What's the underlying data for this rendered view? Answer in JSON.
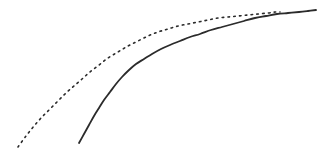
{
  "figure": {
    "title": "",
    "background_color": "#ffffff",
    "width": 331,
    "height": 153
  },
  "chart_data": {
    "type": "line",
    "title": "",
    "subtitle": "",
    "xlabel": "",
    "ylabel": "",
    "xlim": [
      0,
      331
    ],
    "ylim": [
      0,
      153
    ],
    "grid": false,
    "axes_visible": false,
    "tick_labels_x": [],
    "tick_labels_y": [],
    "legend": {
      "visible": false,
      "position": "none",
      "entries": []
    },
    "annotations": [],
    "series": [
      {
        "name": "dotted-curve",
        "style": "dotted",
        "color": "#2b2b2b",
        "line_width": 1.6,
        "dash_pattern": [
          1.6,
          4.2
        ],
        "points": [
          [
            18,
            147
          ],
          [
            26,
            136
          ],
          [
            34,
            126
          ],
          [
            42,
            117
          ],
          [
            50,
            109
          ],
          [
            58,
            101
          ],
          [
            66,
            93
          ],
          [
            74,
            86
          ],
          [
            82,
            79
          ],
          [
            90,
            72
          ],
          [
            99,
            65
          ],
          [
            108,
            58
          ],
          [
            118,
            52
          ],
          [
            128,
            46
          ],
          [
            138,
            41
          ],
          [
            148,
            36
          ],
          [
            158,
            32
          ],
          [
            168,
            29
          ],
          [
            178,
            26
          ],
          [
            188,
            24
          ],
          [
            198,
            22
          ],
          [
            208,
            20
          ],
          [
            218,
            18
          ],
          [
            228,
            17
          ],
          [
            238,
            16
          ],
          [
            248,
            15
          ],
          [
            258,
            14
          ],
          [
            268,
            13
          ],
          [
            275,
            12
          ],
          [
            280,
            12
          ]
        ]
      },
      {
        "name": "solid-curve",
        "style": "solid",
        "color": "#2b2b2b",
        "line_width": 1.8,
        "dash_pattern": [],
        "points": [
          [
            79,
            143
          ],
          [
            84,
            134
          ],
          [
            89,
            125
          ],
          [
            94,
            116
          ],
          [
            99,
            108
          ],
          [
            104,
            100
          ],
          [
            110,
            92
          ],
          [
            116,
            84
          ],
          [
            122,
            77
          ],
          [
            129,
            70
          ],
          [
            136,
            64
          ],
          [
            144,
            59
          ],
          [
            152,
            54
          ],
          [
            161,
            49
          ],
          [
            170,
            45
          ],
          [
            180,
            41
          ],
          [
            190,
            37
          ],
          [
            200,
            34
          ],
          [
            211,
            30
          ],
          [
            222,
            27
          ],
          [
            233,
            24
          ],
          [
            244,
            21
          ],
          [
            255,
            18
          ],
          [
            266,
            16
          ],
          [
            277,
            14
          ],
          [
            288,
            13
          ],
          [
            299,
            12
          ],
          [
            308,
            11
          ],
          [
            316,
            10
          ]
        ]
      }
    ]
  }
}
